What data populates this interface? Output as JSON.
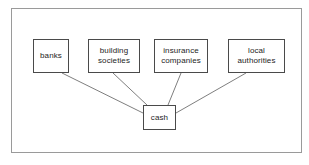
{
  "diagram": {
    "frame": {
      "present": true,
      "stroke": "#9a9a9a"
    },
    "node_stroke": "#4a4a4a",
    "node_fill": "#ffffff",
    "edge_stroke": "#6f6f6f",
    "nodes": [
      {
        "id": "banks",
        "label": "banks"
      },
      {
        "id": "building",
        "label": "building\nsocieties"
      },
      {
        "id": "insurance",
        "label": "insurance\ncompanies"
      },
      {
        "id": "local",
        "label": "local\nauthorities"
      },
      {
        "id": "cash",
        "label": "cash"
      }
    ],
    "edges": [
      {
        "from": "banks",
        "to": "cash",
        "x1": 62,
        "y1": 73,
        "x2": 143,
        "y2": 113
      },
      {
        "from": "building",
        "to": "cash",
        "x1": 113,
        "y1": 73,
        "x2": 147,
        "y2": 105
      },
      {
        "from": "insurance",
        "to": "cash",
        "x1": 181,
        "y1": 73,
        "x2": 168,
        "y2": 105
      },
      {
        "from": "local",
        "to": "cash",
        "x1": 246,
        "y1": 73,
        "x2": 176,
        "y2": 113
      }
    ],
    "caption": ""
  }
}
